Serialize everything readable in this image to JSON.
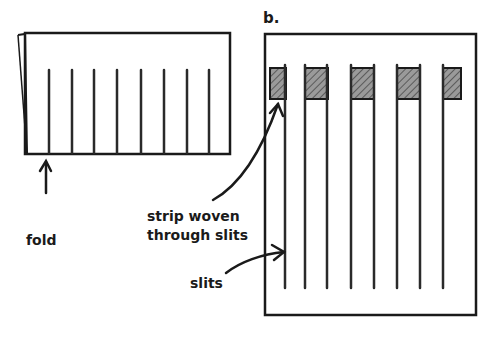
{
  "panel_b": {
    "letter": "b.",
    "hatch_color": "#8c8c8c",
    "line_color": "#1a1a1a"
  },
  "labels": {
    "fold": "fold",
    "strip_line1": "strip woven",
    "strip_line2": "through slits",
    "slits": "slits"
  },
  "panel_a": {
    "slit_count": 8
  },
  "panel_b_slits": {
    "slit_count": 8,
    "woven_squares": 5
  }
}
